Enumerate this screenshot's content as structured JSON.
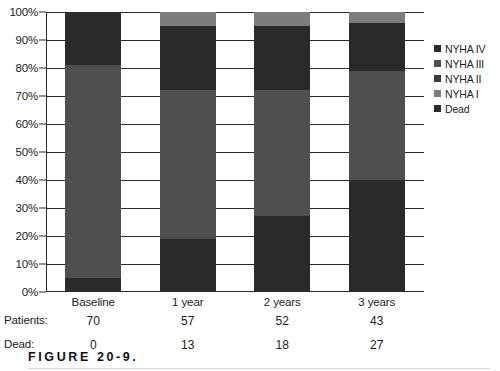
{
  "chart_data": {
    "type": "bar",
    "subtype": "stacked-100-percent",
    "title": "",
    "xlabel": "",
    "ylabel": "",
    "ylim": [
      0,
      100
    ],
    "ytick_labels": [
      "100%",
      "90%",
      "80%",
      "70%",
      "60%",
      "50%",
      "40%",
      "30%",
      "20%",
      "10%",
      "0%"
    ],
    "ytick_values": [
      100,
      90,
      80,
      70,
      60,
      50,
      40,
      30,
      20,
      10,
      0
    ],
    "grid": true,
    "legend_position": "right",
    "categories": [
      "Baseline",
      "1 year",
      "2 years",
      "3 years"
    ],
    "stack_order_bottom_to_top": [
      "Dead",
      "NYHA II",
      "NYHA III",
      "NYHA IV",
      "NYHA I"
    ],
    "series": [
      {
        "name": "Dead",
        "color": "#2a2a2a",
        "values": [
          0,
          19,
          27,
          40
        ]
      },
      {
        "name": "NYHA II",
        "color": "#4f4f4f",
        "values": [
          5,
          0,
          0,
          0
        ]
      },
      {
        "name": "NYHA III",
        "color": "#4f4f4f",
        "values": [
          76,
          53,
          45,
          39
        ]
      },
      {
        "name": "NYHA IV",
        "color": "#2a2a2a",
        "values": [
          19,
          23,
          23,
          17
        ]
      },
      {
        "name": "NYHA I",
        "color": "#7d7d7d",
        "values": [
          0,
          5,
          5,
          4
        ]
      }
    ],
    "stacks": [
      {
        "category": "Baseline",
        "segments": [
          {
            "name": "NYHA II",
            "value": 5,
            "from": 0,
            "to": 5,
            "color": "#2a2a2a"
          },
          {
            "name": "NYHA III",
            "value": 76,
            "from": 5,
            "to": 81,
            "color": "#4f4f4f"
          },
          {
            "name": "NYHA IV",
            "value": 19,
            "from": 81,
            "to": 100,
            "color": "#2a2a2a"
          }
        ]
      },
      {
        "category": "1 year",
        "segments": [
          {
            "name": "Dead",
            "value": 19,
            "from": 0,
            "to": 19,
            "color": "#2a2a2a"
          },
          {
            "name": "NYHA III",
            "value": 53,
            "from": 19,
            "to": 72,
            "color": "#4f4f4f"
          },
          {
            "name": "NYHA IV",
            "value": 23,
            "from": 72,
            "to": 95,
            "color": "#2a2a2a"
          },
          {
            "name": "NYHA I",
            "value": 5,
            "from": 95,
            "to": 100,
            "color": "#7d7d7d"
          }
        ]
      },
      {
        "category": "2 years",
        "segments": [
          {
            "name": "Dead",
            "value": 27,
            "from": 0,
            "to": 27,
            "color": "#2a2a2a"
          },
          {
            "name": "NYHA III",
            "value": 45,
            "from": 27,
            "to": 72,
            "color": "#4f4f4f"
          },
          {
            "name": "NYHA IV",
            "value": 23,
            "from": 72,
            "to": 95,
            "color": "#2a2a2a"
          },
          {
            "name": "NYHA I",
            "value": 5,
            "from": 95,
            "to": 100,
            "color": "#7d7d7d"
          }
        ]
      },
      {
        "category": "3 years",
        "segments": [
          {
            "name": "Dead",
            "value": 40,
            "from": 0,
            "to": 40,
            "color": "#2a2a2a"
          },
          {
            "name": "NYHA III",
            "value": 39,
            "from": 40,
            "to": 79,
            "color": "#4f4f4f"
          },
          {
            "name": "NYHA IV",
            "value": 17,
            "from": 79,
            "to": 96,
            "color": "#2a2a2a"
          },
          {
            "name": "NYHA I",
            "value": 4,
            "from": 96,
            "to": 100,
            "color": "#7d7d7d"
          }
        ]
      }
    ],
    "legend": [
      {
        "label": "NYHA IV",
        "color": "#2a2a2a"
      },
      {
        "label": "NYHA III",
        "color": "#4f4f4f"
      },
      {
        "label": "NYHA II",
        "color": "#3a3a3a"
      },
      {
        "label": "NYHA I",
        "color": "#7d7d7d"
      },
      {
        "label": "Dead",
        "color": "#2a2a2a"
      }
    ],
    "data_rows": [
      {
        "header": "Patients:",
        "values": [
          "70",
          "57",
          "52",
          "43"
        ]
      },
      {
        "header": "Dead:",
        "values": [
          "0",
          "13",
          "18",
          "27"
        ]
      }
    ]
  },
  "caption": {
    "text": "FIGURE 20-9."
  },
  "colors": {
    "dark": "#2a2a2a",
    "medium": "#4f4f4f",
    "light": "#7d7d7d",
    "axis": "#2b2b2b",
    "text": "#1c1c1c",
    "background": "#ffffff"
  }
}
